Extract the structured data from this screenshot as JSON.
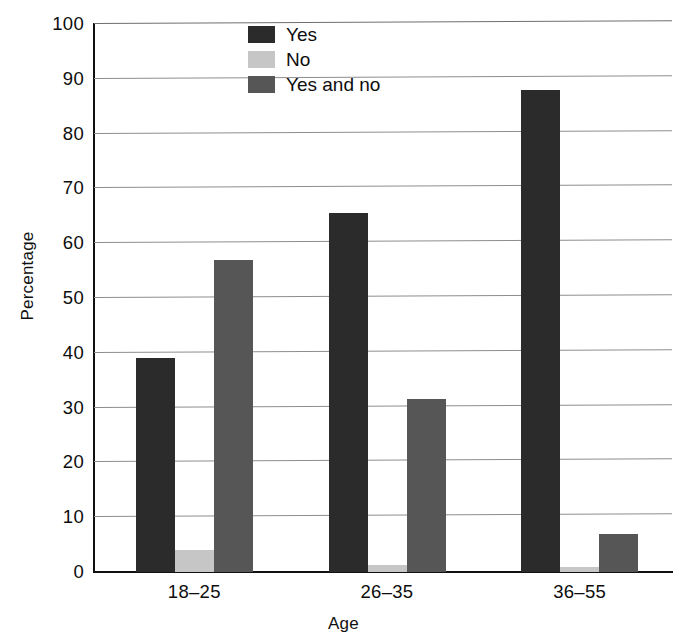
{
  "chart_data": {
    "type": "bar",
    "title": "",
    "xlabel": "Age",
    "ylabel": "Percentage",
    "categories": [
      "18–25",
      "26–35",
      "36–55"
    ],
    "series": [
      {
        "name": "Yes",
        "color": "#2b2b2b",
        "values": [
          39,
          65.5,
          88
        ]
      },
      {
        "name": "No",
        "color": "#c6c6c6",
        "values": [
          4,
          1.2,
          1
        ]
      },
      {
        "name": "Yes and no",
        "color": "#565656",
        "values": [
          57,
          31.5,
          7
        ]
      }
    ],
    "ylim": [
      0,
      100
    ],
    "yticks": [
      0,
      10,
      20,
      30,
      40,
      50,
      60,
      70,
      80,
      90,
      100
    ],
    "ytick_labels": [
      "0",
      "10",
      "20",
      "30",
      "40",
      "50",
      "60",
      "70",
      "80",
      "90",
      "100"
    ],
    "grid": true,
    "grid_axis": "y",
    "legend_position": "upper-center-inside",
    "bar_group_gap": true,
    "background": "#ffffff",
    "axis_color": "#111111",
    "gridline_color": "#8d8d8d"
  },
  "legend": {
    "entries": [
      {
        "label": "Yes"
      },
      {
        "label": "No"
      },
      {
        "label": "Yes and no"
      }
    ]
  },
  "axes": {
    "y_title": "Percentage",
    "x_title": "Age"
  }
}
